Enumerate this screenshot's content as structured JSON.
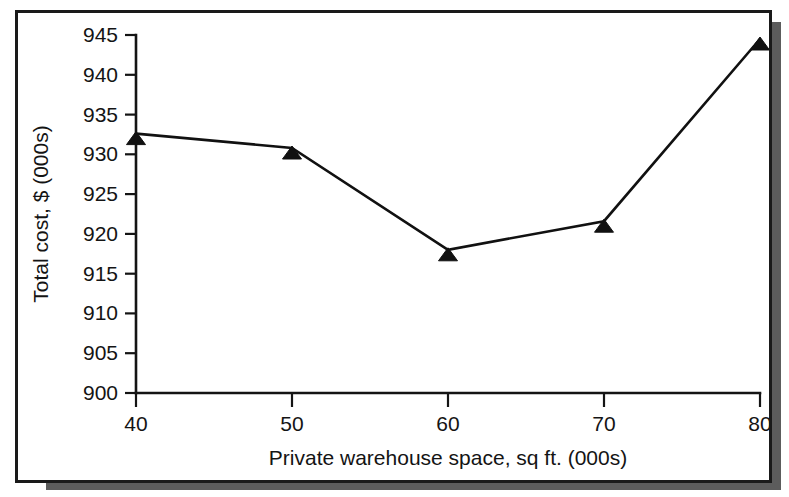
{
  "chart_data": {
    "type": "line",
    "title": "",
    "xlabel": "Private warehouse space, sq ft. (000s)",
    "ylabel": "Total cost, $ (000s)",
    "x": [
      40,
      50,
      60,
      70,
      80
    ],
    "values": [
      932.6,
      930.8,
      918.0,
      921.6,
      944.5
    ],
    "series": [
      {
        "name": "Total cost",
        "values": [
          932.6,
          930.8,
          918.0,
          921.6,
          944.5
        ]
      }
    ],
    "xtick_labels": [
      "40",
      "50",
      "60",
      "70",
      "80"
    ],
    "ytick_labels": [
      "900",
      "905",
      "910",
      "915",
      "920",
      "925",
      "930",
      "935",
      "940",
      "945"
    ],
    "ytick_values": [
      900,
      905,
      910,
      915,
      920,
      925,
      930,
      935,
      940,
      945
    ],
    "xlim": [
      40,
      80
    ],
    "ylim": [
      900,
      945
    ],
    "grid": false,
    "legend": false,
    "marker": "triangle-up",
    "line_color": "#111111",
    "marker_color": "#111111"
  },
  "figure": {
    "frame_color": "#1a1a1a",
    "shadow_color": "#5c5c5c",
    "background": "#ffffff"
  }
}
